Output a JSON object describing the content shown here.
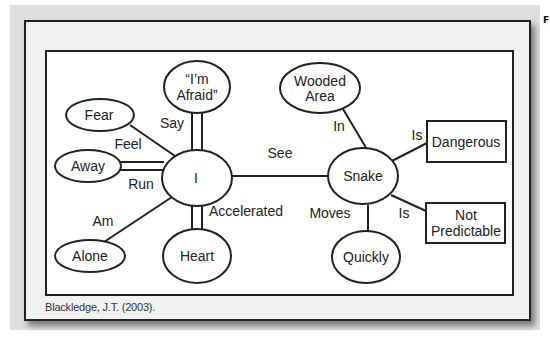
{
  "figure": {
    "citation": "Blackledge, J.T. (2003).",
    "edge_marker": "F"
  },
  "nodes": {
    "afraid": {
      "line1": "“I’m",
      "line2": "Afraid”"
    },
    "fear": {
      "label": "Fear"
    },
    "away": {
      "label": "Away"
    },
    "i": {
      "label": "I"
    },
    "alone": {
      "label": "Alone"
    },
    "heart": {
      "label": "Heart"
    },
    "wooded": {
      "line1": "Wooded",
      "line2": "Area"
    },
    "snake": {
      "label": "Snake"
    },
    "quickly": {
      "label": "Quickly"
    },
    "dangerous": {
      "label": "Dangerous"
    },
    "not_predictable": {
      "line1": "Not",
      "line2": "Predictable"
    }
  },
  "edges": {
    "say": "Say",
    "feel": "Feel",
    "run": "Run",
    "am": "Am",
    "accelerated": "Accelerated",
    "see": "See",
    "in": "In",
    "is_dangerous": "Is",
    "is_not_predictable": "Is",
    "moves": "Moves"
  }
}
